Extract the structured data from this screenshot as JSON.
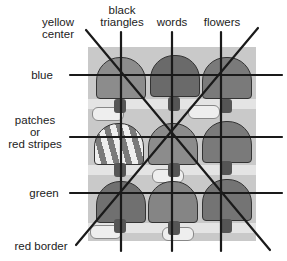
{
  "diagram": {
    "top_labels": [
      {
        "id": "yellow-center",
        "text_lines": [
          "yellow",
          "center"
        ]
      },
      {
        "id": "black-triangles",
        "text_lines": [
          "black",
          "triangles"
        ]
      },
      {
        "id": "words",
        "text_lines": [
          "words"
        ]
      },
      {
        "id": "flowers",
        "text_lines": [
          "flowers"
        ]
      }
    ],
    "left_labels": [
      {
        "id": "blue",
        "text_lines": [
          "blue"
        ]
      },
      {
        "id": "patches-or-red-stripes",
        "text_lines": [
          "patches",
          "or",
          "red stripes"
        ]
      },
      {
        "id": "green",
        "text_lines": [
          "green"
        ]
      },
      {
        "id": "red-border",
        "text_lines": [
          "red border"
        ]
      }
    ],
    "picture_description": "3x3 grid of umbrellas in the rain",
    "colors": {
      "lines": "#1a1a1a",
      "picture_bg": "#c9c9c9",
      "umbrella_dark": "#6a6a6a",
      "umbrella_mid": "#8c8c8c",
      "umbrella_light": "#a8a8a8",
      "text": "#222222"
    }
  }
}
